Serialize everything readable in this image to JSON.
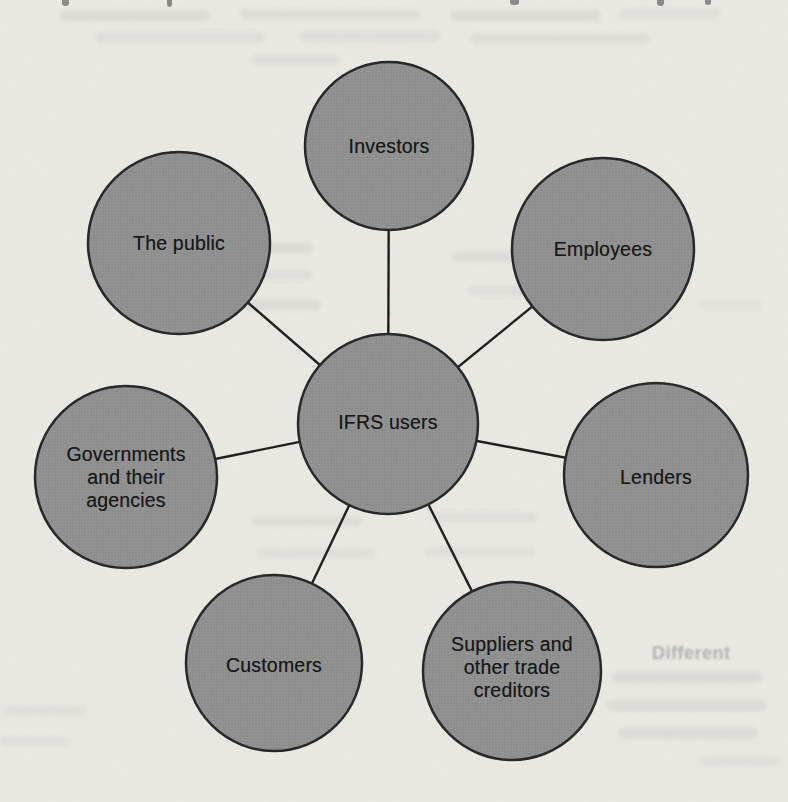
{
  "page": {
    "type": "scanned textbook figure",
    "paper_color": "#eae8e3"
  },
  "diagram": {
    "center": {
      "id": "ifrs-users",
      "label": "IFRS users"
    },
    "nodes": [
      {
        "id": "investors",
        "label": "Investors"
      },
      {
        "id": "employees",
        "label": "Employees"
      },
      {
        "id": "the-public",
        "label": "The public"
      },
      {
        "id": "lenders",
        "label": "Lenders"
      },
      {
        "id": "governments",
        "label": "Governments\nand their\nagencies"
      },
      {
        "id": "customers",
        "label": "Customers"
      },
      {
        "id": "suppliers",
        "label": "Suppliers and\nother trade\ncreditors"
      }
    ],
    "node_fill": "#8f9090",
    "node_stroke": "#262626",
    "connector_color": "#1d1d1d",
    "label_color": "#161616"
  },
  "ghost_text": {
    "note": "faint illegible show-through text from the scanned book page",
    "fragments": [
      {
        "text": "Different"
      }
    ]
  }
}
